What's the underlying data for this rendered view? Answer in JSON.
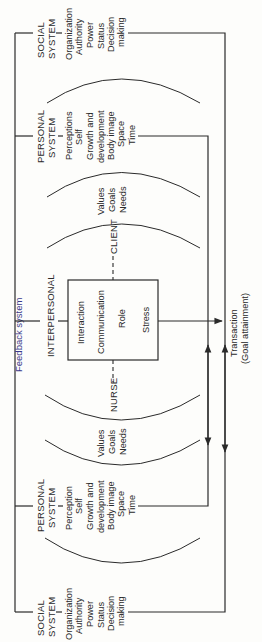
{
  "feedback": {
    "label": "Feedback system"
  },
  "social_top": {
    "title_line1": "SOCIAL",
    "title_line2": "SYSTEM",
    "items": [
      "Organization",
      "Authority",
      "Power",
      "Status",
      "Decision",
      "making"
    ]
  },
  "personal_top": {
    "title_line1": "PERSONAL",
    "title_line2": "SYSTEM",
    "items": [
      "Perceptions",
      "Self",
      "Growth and",
      "development",
      "Body image",
      "Space",
      "Time"
    ]
  },
  "client_values": {
    "items": [
      "Values",
      "Goals",
      "Needs"
    ]
  },
  "client": {
    "label": "CLIENT"
  },
  "interpersonal": {
    "label": "INTERPERSONAL",
    "box_items": [
      "Interaction",
      "Communication",
      "Role",
      "Stress"
    ]
  },
  "nurse": {
    "label": "NURSE"
  },
  "nurse_values": {
    "items": [
      "Values",
      "Goals",
      "Needs"
    ]
  },
  "personal_bottom": {
    "title_line1": "PERSONAL",
    "title_line2": "SYSTEM",
    "items": [
      "Perception",
      "Self",
      "Growth and",
      "development",
      "Body image",
      "Space",
      "Time"
    ]
  },
  "social_bottom": {
    "title_line1": "SOCIAL",
    "title_line2": "SYSTEM",
    "items": [
      "Organization",
      "Authority",
      "Power",
      "Status",
      "Decision",
      "making"
    ]
  },
  "outcome": {
    "line1": "Transaction",
    "line2": "(Goal attainment)"
  },
  "colors": {
    "line": "#2a2a2a",
    "feedback_text": "#3a3a8a",
    "background": "#fdfdfb"
  }
}
